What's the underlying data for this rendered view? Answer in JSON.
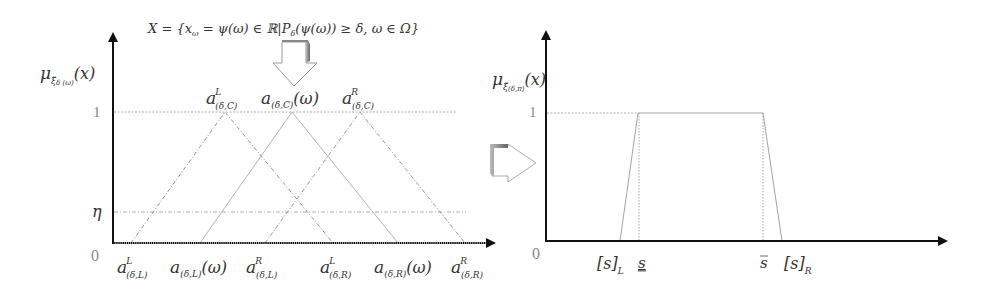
{
  "left_panel": {
    "set_definition": "X = {x_ω = ψ(ω) ∈ ℝ | P_δ(ψ(ω)) ≥ δ, ω ∈ Ω}",
    "set_parts": {
      "lhs": "X = {x",
      "lhs_sub": "ω",
      "rhs": " = ψ(ω) ∈ ℝ|P",
      "rhs_sub": "δ",
      "tail": "(ψ(ω)) ≥ δ, ω ∈ Ω}"
    },
    "y_axis_label": {
      "main": "μ",
      "sub": "ξ̃",
      "subsub": "δ (ω)",
      "arg": "(x)"
    },
    "y_ticks": {
      "one": "1",
      "eta": "η",
      "zero": "0"
    },
    "top_labels": [
      {
        "base": "a",
        "sup": "L",
        "sub": "(δ,C)"
      },
      {
        "base": "a",
        "sup": "",
        "sub": "(δ,C)",
        "arg": "(ω)"
      },
      {
        "base": "a",
        "sup": "R",
        "sub": "(δ,C)"
      }
    ],
    "bottom_labels": [
      {
        "base": "a",
        "sup": "L",
        "sub": "(δ,L)"
      },
      {
        "base": "a",
        "sup": "",
        "sub": "(δ,L)",
        "arg": "(ω)"
      },
      {
        "base": "a",
        "sup": "R",
        "sub": "(δ,L)"
      },
      {
        "base": "a",
        "sup": "L",
        "sub": "(δ,R)"
      },
      {
        "base": "a",
        "sup": "",
        "sub": "(δ,R)",
        "arg": "(ω)"
      },
      {
        "base": "a",
        "sup": "R",
        "sub": "(δ,R)"
      }
    ]
  },
  "right_panel": {
    "y_axis_label": {
      "main": "μ",
      "sub": "ξ̃",
      "subsub": "(δ,π)",
      "arg": "(x)"
    },
    "y_ticks": {
      "one": "1",
      "zero": "0"
    },
    "bottom_labels": {
      "s_L": "[s]",
      "s_L_sub": "L",
      "s_lower": "s",
      "s_upper": "s",
      "s_R": "[s]",
      "s_R_sub": "R"
    }
  },
  "colors": {
    "axis": "#111111",
    "guide": "#999999",
    "curve": "#888888",
    "arrow_outline": "#999999",
    "arrow_shadow": "#777777"
  }
}
